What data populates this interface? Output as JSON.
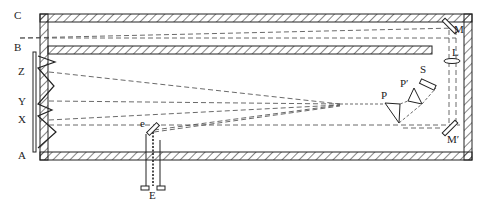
{
  "diagram": {
    "type": "spectrograph-apparatus-schematic",
    "colors": {
      "ink": "#222222",
      "background": "#ffffff"
    },
    "labels": {
      "C": "C",
      "B": "B",
      "Z": "Z",
      "Y": "Y",
      "X": "X",
      "A": "A",
      "M": "M",
      "L": "L",
      "S": "S",
      "P_prime": "P′",
      "P": "P",
      "M_prime": "M′",
      "e": "e",
      "E": "E"
    },
    "components": [
      {
        "id": "outer-enclosure",
        "desc": "hatched rectangular housing"
      },
      {
        "id": "inner-baffle",
        "desc": "hatched horizontal partition forming upper channel"
      },
      {
        "id": "plate",
        "desc": "photographic plate A–B on left"
      },
      {
        "id": "zigzag-spectra",
        "desc": "zigzag trace with points X, Y, Z"
      },
      {
        "id": "mirror-M",
        "desc": "upper right mirror"
      },
      {
        "id": "lens-L",
        "desc": "lens below mirror M"
      },
      {
        "id": "mirror-M-prime",
        "desc": "lower right mirror"
      },
      {
        "id": "source-S",
        "desc": "light source S"
      },
      {
        "id": "prism-P-prime",
        "desc": "small prism P′"
      },
      {
        "id": "prism-P",
        "desc": "triangular prism P"
      },
      {
        "id": "slit-e",
        "desc": "slit/electrode e"
      },
      {
        "id": "electrode-E",
        "desc": "electrode holder E passing through housing"
      }
    ]
  }
}
